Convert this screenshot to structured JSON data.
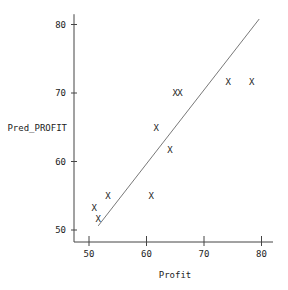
{
  "chart_data": {
    "type": "scatter",
    "title": "",
    "xlabel": "Profit",
    "ylabel": "Pred_PROFIT",
    "xlim": [
      48,
      82
    ],
    "ylim": [
      48,
      81
    ],
    "x_ticks": [
      50,
      60,
      70,
      80
    ],
    "y_ticks": [
      50,
      60,
      70,
      80
    ],
    "grid": false,
    "marker": "X",
    "points": [
      {
        "x": 50.9,
        "y": 53.2
      },
      {
        "x": 51.6,
        "y": 51.6
      },
      {
        "x": 53.3,
        "y": 55.0
      },
      {
        "x": 60.8,
        "y": 55.0
      },
      {
        "x": 61.7,
        "y": 64.9
      },
      {
        "x": 64.1,
        "y": 61.7
      },
      {
        "x": 65.0,
        "y": 70.0
      },
      {
        "x": 65.8,
        "y": 70.0
      },
      {
        "x": 74.2,
        "y": 71.6
      },
      {
        "x": 78.3,
        "y": 71.6
      }
    ],
    "fit_line": {
      "x1": 51.6,
      "y1": 50.6,
      "x2": 79.6,
      "y2": 80.8
    },
    "colors": {
      "axis": "#444444",
      "marker": "#222222",
      "line": "#555555"
    }
  }
}
